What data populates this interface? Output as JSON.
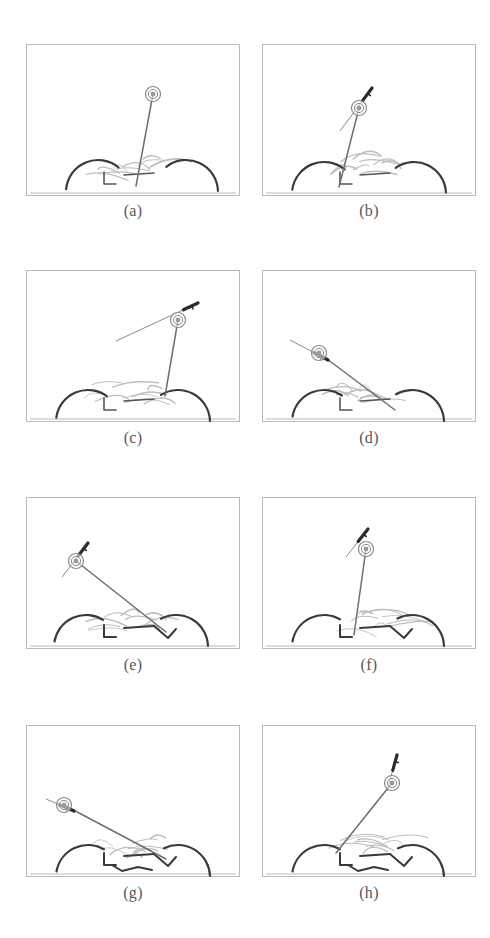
{
  "figure": {
    "title": "",
    "panel_count": 8,
    "panel_width": 214,
    "panel_height": 152,
    "colors": {
      "frame": "#b9b9b9",
      "pole": "#6e6e6e",
      "marker_ring": "#8a8a8a",
      "marker_core": "#9a9a9a",
      "arm_dark": "#3a3a3a",
      "sketch_light": "#bdbdbd",
      "arrow": "#2b2b2b",
      "caption": "#575757",
      "background": "#ffffff"
    },
    "panels": [
      {
        "id": "a",
        "caption": "(a)",
        "marker": {
          "x": 127,
          "y": 50
        },
        "pole": {
          "x1": 127,
          "y1": 50,
          "x2": 110,
          "y2": 142
        },
        "vector": null,
        "arms": [
          {
            "side": "left",
            "cx": 72,
            "cy": 148,
            "r": 32,
            "start_deg": 185,
            "end_deg": 310
          },
          {
            "side": "right",
            "cx": 160,
            "cy": 148,
            "r": 32,
            "start_deg": 232,
            "end_deg": 358
          }
        ],
        "sketch_seed": 1
      },
      {
        "id": "b",
        "caption": "(b)",
        "marker": {
          "x": 97,
          "y": 64
        },
        "pole": {
          "x1": 97,
          "y1": 64,
          "x2": 77,
          "y2": 143
        },
        "vector": {
          "x1": 78,
          "y1": 87,
          "x2": 110,
          "y2": 44,
          "head": "up-right"
        },
        "arms": [
          {
            "side": "left",
            "cx": 62,
            "cy": 150,
            "r": 32,
            "start_deg": 188,
            "end_deg": 310
          },
          {
            "side": "right",
            "cx": 152,
            "cy": 150,
            "r": 32,
            "start_deg": 235,
            "end_deg": 357
          }
        ],
        "sketch_seed": 2
      },
      {
        "id": "c",
        "caption": "(c)",
        "marker": {
          "x": 152,
          "y": 50
        },
        "pole": {
          "x1": 152,
          "y1": 50,
          "x2": 139,
          "y2": 126
        },
        "vector": {
          "x1": 90,
          "y1": 71,
          "x2": 172,
          "y2": 33,
          "head": "up-right"
        },
        "arms": [
          {
            "side": "left",
            "cx": 62,
            "cy": 152,
            "r": 32,
            "start_deg": 188,
            "end_deg": 306
          },
          {
            "side": "right",
            "cx": 152,
            "cy": 152,
            "r": 32,
            "start_deg": 238,
            "end_deg": 358
          }
        ],
        "sketch_seed": 3
      },
      {
        "id": "d",
        "caption": "(d)",
        "marker": {
          "x": 57,
          "y": 83
        },
        "pole": {
          "x1": 57,
          "y1": 83,
          "x2": 133,
          "y2": 140
        },
        "vector": {
          "x1": 28,
          "y1": 70,
          "x2": 66,
          "y2": 90,
          "head": "up-left"
        },
        "arms": [
          {
            "side": "left",
            "cx": 62,
            "cy": 152,
            "r": 32,
            "start_deg": 190,
            "end_deg": 304
          },
          {
            "side": "right",
            "cx": 150,
            "cy": 152,
            "r": 32,
            "start_deg": 240,
            "end_deg": 358
          }
        ],
        "sketch_seed": 4
      },
      {
        "id": "e",
        "caption": "(e)",
        "marker": {
          "x": 50,
          "y": 64
        },
        "pole": {
          "x1": 50,
          "y1": 64,
          "x2": 140,
          "y2": 135
        },
        "vector": {
          "x1": 36,
          "y1": 80,
          "x2": 62,
          "y2": 46,
          "head": "up-right"
        },
        "arms": [
          {
            "side": "left",
            "cx": 60,
            "cy": 150,
            "r": 32,
            "start_deg": 190,
            "end_deg": 302
          },
          {
            "side": "right",
            "cx": 150,
            "cy": 150,
            "r": 32,
            "start_deg": 242,
            "end_deg": 358
          }
        ],
        "sketch_seed": 5
      },
      {
        "id": "f",
        "caption": "(f)",
        "marker": {
          "x": 104,
          "y": 52
        },
        "pole": {
          "x1": 104,
          "y1": 52,
          "x2": 92,
          "y2": 138
        },
        "vector": {
          "x1": 84,
          "y1": 60,
          "x2": 106,
          "y2": 32,
          "head": "up-right"
        },
        "arms": [
          {
            "side": "left",
            "cx": 62,
            "cy": 150,
            "r": 32,
            "start_deg": 190,
            "end_deg": 300
          },
          {
            "side": "right",
            "cx": 150,
            "cy": 150,
            "r": 32,
            "start_deg": 243,
            "end_deg": 358
          }
        ],
        "sketch_seed": 6
      },
      {
        "id": "g",
        "caption": "(g)",
        "marker": {
          "x": 38,
          "y": 80
        },
        "pole": {
          "x1": 38,
          "y1": 80,
          "x2": 140,
          "y2": 134
        },
        "vector": {
          "x1": 20,
          "y1": 74,
          "x2": 48,
          "y2": 86,
          "head": "left"
        },
        "arms": [
          {
            "side": "left",
            "cx": 62,
            "cy": 152,
            "r": 32,
            "start_deg": 190,
            "end_deg": 300
          },
          {
            "side": "right",
            "cx": 152,
            "cy": 152,
            "r": 32,
            "start_deg": 244,
            "end_deg": 358
          }
        ],
        "sketch_seed": 7
      },
      {
        "id": "h",
        "caption": "(h)",
        "marker": {
          "x": 130,
          "y": 58
        },
        "pole": {
          "x1": 130,
          "y1": 58,
          "x2": 74,
          "y2": 128
        },
        "vector": {
          "x1": 125,
          "y1": 66,
          "x2": 135,
          "y2": 30,
          "head": "up"
        },
        "arms": [
          {
            "side": "left",
            "cx": 62,
            "cy": 152,
            "r": 32,
            "start_deg": 190,
            "end_deg": 300
          },
          {
            "side": "right",
            "cx": 150,
            "cy": 152,
            "r": 32,
            "start_deg": 244,
            "end_deg": 358
          }
        ],
        "sketch_seed": 8
      }
    ]
  }
}
